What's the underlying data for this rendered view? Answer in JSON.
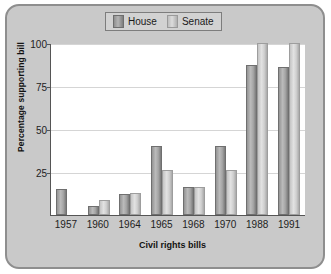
{
  "chart_data": {
    "type": "bar",
    "title": "",
    "xlabel": "Civil rights bills",
    "ylabel": "Percentage supporting bill",
    "categories": [
      "1957",
      "1960",
      "1964",
      "1965",
      "1968",
      "1970",
      "1988",
      "1991"
    ],
    "series": [
      {
        "name": "House",
        "color": "#9a9a9a",
        "values": [
          15,
          5,
          12,
          40,
          16,
          40,
          87,
          86
        ]
      },
      {
        "name": "Senate",
        "color": "#cfcfcf",
        "values": [
          null,
          9,
          13,
          26,
          16,
          26,
          100,
          100
        ]
      }
    ],
    "ylim": [
      0,
      100
    ],
    "yticks": [
      25,
      50,
      75,
      100
    ],
    "ytick_labels": [
      "25",
      "50",
      "75",
      "100"
    ],
    "grid": true,
    "legend_position": "top-center",
    "legend_entries": [
      "House",
      "Senate"
    ]
  },
  "legend": {
    "house_label": "House",
    "senate_label": "Senate"
  },
  "axes": {
    "y_title": "Percentage supporting bill",
    "x_title": "Civil rights bills"
  }
}
